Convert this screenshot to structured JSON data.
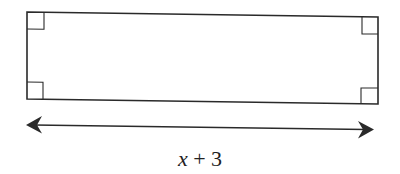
{
  "diagram": {
    "shape": "rectangle",
    "right_angle_markers": 4,
    "dimension_label": {
      "variable": "x",
      "operator": "+",
      "constant": "3",
      "full": "x + 3"
    },
    "colors": {
      "stroke": "#2a2a2a",
      "background": "#ffffff"
    }
  }
}
